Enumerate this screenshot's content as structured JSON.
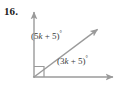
{
  "problem": {
    "number_label": "16."
  },
  "figure": {
    "type": "angle-diagram",
    "background_color": "#ffffff",
    "stroke_color": "#9a9a9a",
    "text_color": "#3b3b3b",
    "vertex": {
      "x": 34,
      "y": 77
    },
    "rays": [
      {
        "name": "vertical-ray",
        "from": {
          "x": 34,
          "y": 77
        },
        "to": {
          "x": 34,
          "y": 9
        },
        "arrow": true
      },
      {
        "name": "diagonal-ray",
        "from": {
          "x": 34,
          "y": 77
        },
        "to": {
          "x": 101,
          "y": 26
        },
        "arrow": true
      },
      {
        "name": "horizontal-ray",
        "from": {
          "x": 34,
          "y": 77
        },
        "to": {
          "x": 117,
          "y": 77
        },
        "arrow": true
      }
    ],
    "right_angle_marker": {
      "name": "right-angle-square",
      "x": 34,
      "y": 66,
      "size": 10
    }
  },
  "labels": {
    "upper_angle": {
      "full_text": "(5k + 5)°",
      "prefix": "(5",
      "variable": "k",
      "suffix": " + 5)",
      "degree": "°"
    },
    "lower_angle": {
      "full_text": "(3k + 5)°",
      "prefix": "(3",
      "variable": "k",
      "suffix": " + 5)",
      "degree": "°"
    }
  }
}
